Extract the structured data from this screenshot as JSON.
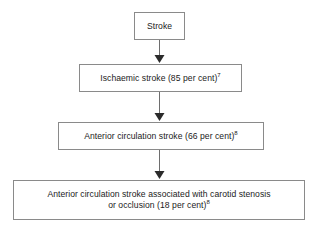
{
  "diagram": {
    "orientation": "vertical-top-down",
    "background_color": "#ffffff",
    "box_border_color": "#8a8a8a",
    "arrow_color": "#2b2b2b",
    "text_color": "#1b1b1b",
    "nodes": [
      {
        "id": "stroke",
        "label": "Stroke",
        "superscript": "",
        "level": 1
      },
      {
        "id": "ischaemic",
        "label": "Ischaemic stroke (85 per cent)",
        "superscript": "7",
        "level": 2
      },
      {
        "id": "anterior",
        "label": "Anterior circulation stroke (66 per cent)",
        "superscript": "8",
        "level": 3
      },
      {
        "id": "carotid",
        "label_line_1": "Anterior circulation stroke associated with carotid stenosis",
        "label_line_2": "or occlusion (18 per cent)",
        "superscript": "8",
        "level": 4
      }
    ],
    "edges": [
      {
        "from": "stroke",
        "to": "ischaemic",
        "style": "solid-arrow"
      },
      {
        "from": "ischaemic",
        "to": "anterior",
        "style": "solid-arrow"
      },
      {
        "from": "anterior",
        "to": "carotid",
        "style": "solid-arrow"
      }
    ]
  }
}
